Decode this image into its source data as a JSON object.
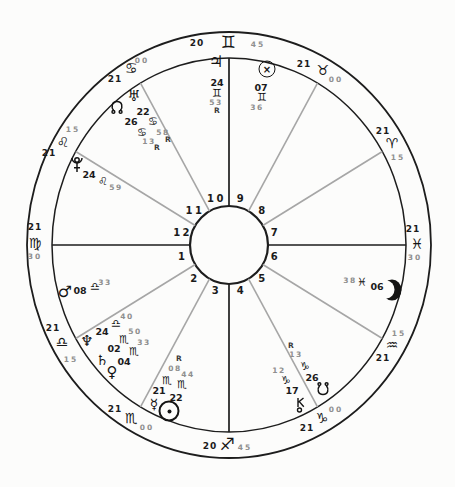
{
  "chart": {
    "type": "natal-wheel",
    "houses": [
      "1",
      "2",
      "3",
      "4",
      "5",
      "6",
      "7",
      "8",
      "9",
      "10",
      "11",
      "12"
    ],
    "cusps": [
      {
        "house": 1,
        "sign": "virgo",
        "glyph": "♍",
        "deg": "21",
        "min": "30"
      },
      {
        "house": 2,
        "sign": "libra",
        "glyph": "♎",
        "deg": "21",
        "min": "15"
      },
      {
        "house": 3,
        "sign": "scorpio",
        "glyph": "♏",
        "deg": "21",
        "min": "00"
      },
      {
        "house": 4,
        "sign": "sagittarius",
        "glyph": "♐",
        "deg": "20",
        "min": "45"
      },
      {
        "house": 5,
        "sign": "capricorn",
        "glyph": "♑",
        "deg": "21",
        "min": "00"
      },
      {
        "house": 6,
        "sign": "aquarius",
        "glyph": "♒",
        "deg": "21",
        "min": "15"
      },
      {
        "house": 7,
        "sign": "pisces",
        "glyph": "♓",
        "deg": "21",
        "min": "30"
      },
      {
        "house": 8,
        "sign": "aries",
        "glyph": "♈",
        "deg": "21",
        "min": "15"
      },
      {
        "house": 9,
        "sign": "taurus",
        "glyph": "♉",
        "deg": "21",
        "min": "00"
      },
      {
        "house": 10,
        "sign": "gemini",
        "glyph": "♊",
        "deg": "20",
        "min": "45"
      },
      {
        "house": 11,
        "sign": "cancer",
        "glyph": "♋",
        "deg": "21",
        "min": "00"
      },
      {
        "house": 12,
        "sign": "leo",
        "glyph": "♌",
        "deg": "21",
        "min": "15"
      }
    ],
    "planets": [
      {
        "id": "sun",
        "name": "Sun",
        "icon": "sun-icon",
        "glyph": "☉",
        "deg": "22",
        "sign": "scorpio",
        "sign_glyph": "♏",
        "min": "44",
        "retro": ""
      },
      {
        "id": "moon",
        "name": "Moon",
        "icon": "moon-icon",
        "glyph": "☽",
        "deg": "06",
        "sign": "pisces",
        "sign_glyph": "♓",
        "min": "38",
        "retro": ""
      },
      {
        "id": "mercury",
        "name": "Mercury",
        "icon": "mercury-icon",
        "glyph": "☿",
        "deg": "21",
        "sign": "scorpio",
        "sign_glyph": "♏",
        "min": "08",
        "retro": "R"
      },
      {
        "id": "venus",
        "name": "Venus",
        "icon": "venus-icon",
        "glyph": "♀",
        "deg": "04",
        "sign": "scorpio",
        "sign_glyph": "♏",
        "min": "33",
        "retro": ""
      },
      {
        "id": "mars",
        "name": "Mars",
        "icon": "mars-icon",
        "glyph": "♂",
        "deg": "08",
        "sign": "libra",
        "sign_glyph": "♎",
        "min": "33",
        "retro": ""
      },
      {
        "id": "jupiter",
        "name": "Jupiter",
        "icon": "jupiter-icon",
        "glyph": "♃",
        "deg": "24",
        "sign": "gemini",
        "sign_glyph": "♊",
        "min": "53",
        "retro": "R"
      },
      {
        "id": "saturn",
        "name": "Saturn",
        "icon": "saturn-icon",
        "glyph": "♄",
        "deg": "02",
        "sign": "scorpio",
        "sign_glyph": "♏",
        "min": "50",
        "retro": ""
      },
      {
        "id": "uranus",
        "name": "Uranus",
        "icon": "uranus-icon",
        "glyph": "♅",
        "deg": "22",
        "sign": "cancer",
        "sign_glyph": "♋",
        "min": "58",
        "retro": "R"
      },
      {
        "id": "neptune",
        "name": "Neptune",
        "icon": "neptune-icon",
        "glyph": "♆",
        "deg": "24",
        "sign": "libra",
        "sign_glyph": "♎",
        "min": "40",
        "retro": ""
      },
      {
        "id": "pluto",
        "name": "Pluto",
        "icon": "pluto-icon",
        "glyph": "♇",
        "deg": "24",
        "sign": "leo",
        "sign_glyph": "♌",
        "min": "59",
        "retro": ""
      },
      {
        "id": "north-node",
        "name": "North Node",
        "icon": "north-node-icon",
        "glyph": "☊",
        "deg": "26",
        "sign": "cancer",
        "sign_glyph": "♋",
        "min": "13",
        "retro": "R"
      },
      {
        "id": "south-node",
        "name": "South Node",
        "icon": "south-node-icon",
        "glyph": "☋",
        "deg": "26",
        "sign": "capricorn",
        "sign_glyph": "♑",
        "min": "13",
        "retro": "R"
      },
      {
        "id": "chiron",
        "name": "Chiron",
        "icon": "chiron-icon",
        "glyph": "⚷",
        "deg": "17",
        "sign": "capricorn",
        "sign_glyph": "♑",
        "min": "12",
        "retro": ""
      },
      {
        "id": "part-of-fortune",
        "name": "Part of Fortune",
        "icon": "part-of-fortune-icon",
        "glyph": "⊗",
        "deg": "07",
        "sign": "gemini",
        "sign_glyph": "♊",
        "min": "36",
        "retro": ""
      }
    ],
    "colors": {
      "line": "#1d1d1d",
      "cusp_gray": "#a6a6a6",
      "minute_gray": "#8e8e8e",
      "background": "#fcfcfb"
    }
  }
}
